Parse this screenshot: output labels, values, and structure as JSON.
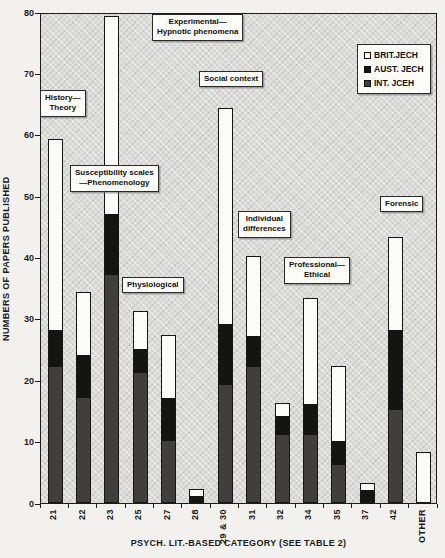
{
  "chart_data": {
    "type": "bar",
    "stacked": true,
    "grid": false,
    "title": "",
    "xlabel": "PSYCH. LIT.-BASED CATEGORY (SEE TABLE 2)",
    "ylabel": "NUMBERS OF PAPERS PUBLISHED",
    "ylim": [
      0,
      80
    ],
    "yticks": [
      "0",
      "10",
      "20",
      "30",
      "40",
      "50",
      "60",
      "70",
      "80"
    ],
    "categories": [
      "21",
      "22",
      "23",
      "25",
      "27",
      "28",
      "29 & 30",
      "31",
      "32",
      "34",
      "35",
      "37",
      "42",
      "OTHER"
    ],
    "series": [
      {
        "name": "INT. JCEH",
        "color": "#403f3c",
        "values": [
          22,
          17,
          37,
          21,
          10,
          0,
          19,
          22,
          11,
          11,
          6,
          0,
          15,
          0
        ]
      },
      {
        "name": "AUST. JECH",
        "color": "#141413",
        "values": [
          6,
          7,
          10,
          4,
          7,
          1,
          10,
          5,
          3,
          5,
          4,
          2,
          13,
          0
        ]
      },
      {
        "name": "BRIT.JECH",
        "color": "#fbfbf7",
        "values": [
          31,
          10,
          32,
          6,
          10,
          1,
          35,
          13,
          2,
          17,
          12,
          1,
          15,
          8
        ]
      }
    ],
    "totals": [
      59,
      34,
      79,
      31,
      27,
      2,
      64,
      40,
      16,
      33,
      22,
      3,
      43,
      8
    ],
    "legend": {
      "position": "top-right",
      "items": [
        {
          "label": "BRIT.JECH",
          "color": "#fbfbf7"
        },
        {
          "label": "AUST. JECH",
          "color": "#141413"
        },
        {
          "label": "INT. JCEH",
          "color": "#403f3c"
        }
      ]
    },
    "annotations": [
      {
        "id": "history",
        "lines": [
          "History—",
          "Theory"
        ],
        "left": 40,
        "top": 90
      },
      {
        "id": "experimental",
        "lines": [
          "Experimental—",
          "Hypnotic phenomena"
        ],
        "left": 152,
        "top": 14
      },
      {
        "id": "susceptibility",
        "lines": [
          "Susceptibility scales",
          "—Phenomenology"
        ],
        "left": 70,
        "top": 165
      },
      {
        "id": "physiological",
        "lines": [
          "Physiological"
        ],
        "left": 122,
        "top": 277
      },
      {
        "id": "social",
        "lines": [
          "Social context"
        ],
        "left": 199,
        "top": 71
      },
      {
        "id": "individual",
        "lines": [
          "Individual",
          "differences"
        ],
        "left": 238,
        "top": 211
      },
      {
        "id": "professional",
        "lines": [
          "Professional—",
          "Ethical"
        ],
        "left": 284,
        "top": 257
      },
      {
        "id": "forensic",
        "lines": [
          "Forensic"
        ],
        "left": 380,
        "top": 196
      }
    ]
  }
}
